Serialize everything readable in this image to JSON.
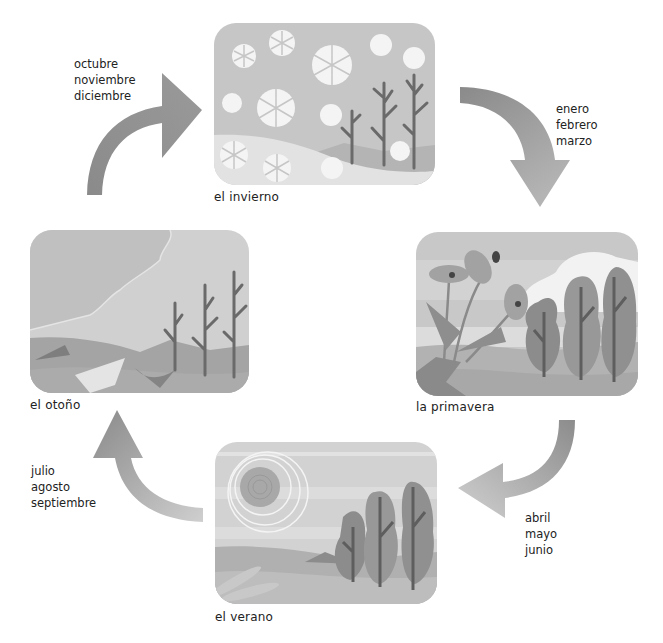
{
  "seasons": {
    "winter": {
      "label": "el invierno",
      "months": [
        "octubre",
        "noviembre",
        "diciembre"
      ]
    },
    "spring": {
      "label": "la primavera",
      "months": [
        "enero",
        "febrero",
        "marzo"
      ]
    },
    "summer": {
      "label": "el verano",
      "months": [
        "abril",
        "mayo",
        "junio"
      ]
    },
    "autumn": {
      "label": "el otoño",
      "months": [
        "julio",
        "agosto",
        "septiembre"
      ]
    }
  },
  "colors": {
    "arrow": "#8c8c8c",
    "sky": "#c8c8c8",
    "ground": "#a0a0a0",
    "tree": "#6e6e6e",
    "text": "#222222"
  }
}
